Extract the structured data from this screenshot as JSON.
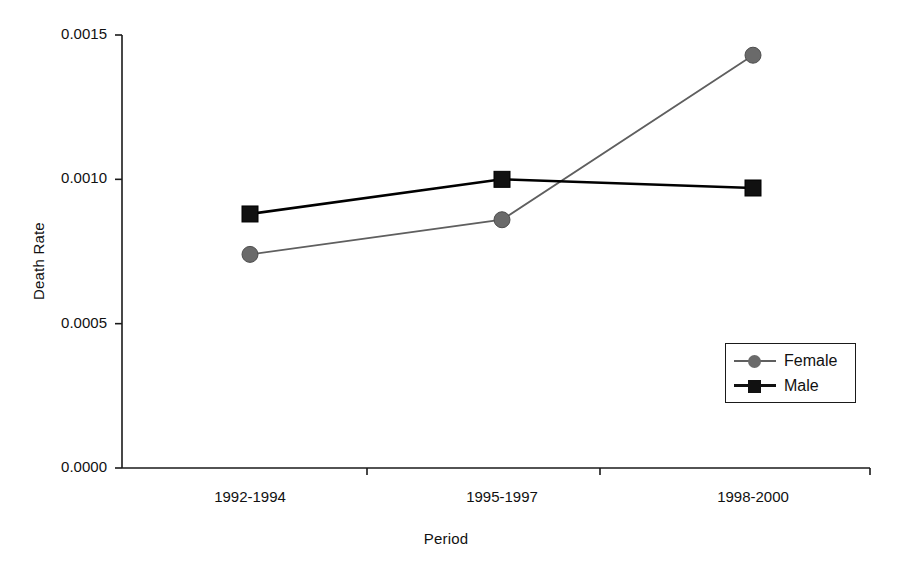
{
  "chart_data": {
    "type": "line",
    "title": "",
    "xlabel": "Period",
    "ylabel": "Death Rate",
    "categories": [
      "1992-1994",
      "1995-1997",
      "1998-2000"
    ],
    "ylim": [
      0.0,
      0.0015
    ],
    "yticks": [
      "0.0000",
      "0.0005",
      "0.0010",
      "0.0015"
    ],
    "ytick_values": [
      0.0,
      0.0005,
      0.001,
      0.0015
    ],
    "grid": false,
    "legend_position": "center-right",
    "series": [
      {
        "name": "Female",
        "values": [
          0.00074,
          0.00086,
          0.00143
        ],
        "color": "#5f5f5f",
        "marker": "circle"
      },
      {
        "name": "Male",
        "values": [
          0.00088,
          0.001,
          0.00097
        ],
        "color": "#000000",
        "marker": "square"
      }
    ]
  },
  "legend": {
    "items": [
      {
        "label": "Female",
        "marker": "circle-marker-icon",
        "color": "#5f5f5f"
      },
      {
        "label": "Male",
        "marker": "square-marker-icon",
        "color": "#111111"
      }
    ]
  },
  "axes": {
    "y_title": "Death Rate",
    "x_title": "Period",
    "y_tick_labels": [
      "0.0015",
      "0.0010",
      "0.0005",
      "0.0000"
    ],
    "x_tick_labels": [
      "1992-1994",
      "1995-1997",
      "1998-2000"
    ],
    "axis_color": "#1a1a1a"
  }
}
